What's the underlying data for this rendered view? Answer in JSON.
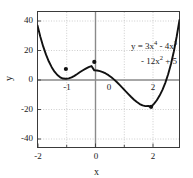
{
  "chart_data": {
    "type": "line",
    "title": "",
    "xlabel": "x",
    "ylabel": "y",
    "equation_line1": "y = 3x4 - 4x3",
    "equation_line2": "- 12x2 + 5",
    "equation_plain": "y = 3x^4 - 4x^3 - 12x^2 + 5",
    "xlim": [
      -2,
      3
    ],
    "ylim": [
      -50,
      47
    ],
    "xticks": [
      -2,
      0,
      2
    ],
    "xtick_labels": [
      "-2",
      "0",
      "2"
    ],
    "yticks": [
      -40,
      -20,
      0,
      20,
      40
    ],
    "ytick_labels": [
      "-40",
      "-20",
      "0",
      "20",
      "40"
    ],
    "inner_xticks": [
      -1,
      0,
      2
    ],
    "inner_xtick_labels": [
      "-1",
      "0",
      "2"
    ],
    "grid": true,
    "grid_style": "dotted",
    "legend": "none",
    "series": [
      {
        "name": "y = 3x^4 - 4x^3 - 12x^2 + 5",
        "x": [
          -2.0,
          -1.9,
          -1.8,
          -1.7,
          -1.6,
          -1.5,
          -1.4,
          -1.3,
          -1.2,
          -1.1,
          -1.0,
          -0.9,
          -0.8,
          -0.7,
          -0.6,
          -0.5,
          -0.4,
          -0.3,
          -0.2,
          -0.1,
          0.0,
          0.1,
          0.2,
          0.3,
          0.4,
          0.5,
          0.6,
          0.7,
          0.8,
          0.9,
          1.0,
          1.1,
          1.2,
          1.3,
          1.4,
          1.5,
          1.6,
          1.7,
          1.8,
          1.9,
          2.0,
          2.1,
          2.2,
          2.3,
          2.4,
          2.5,
          2.6,
          2.7,
          2.8,
          2.9,
          3.0
        ],
        "y": [
          37.0,
          29.0,
          22.1,
          16.2,
          11.3,
          7.3,
          4.1,
          1.7,
          0.1,
          -0.8,
          -1.0,
          -0.7,
          0.0,
          1.1,
          2.4,
          3.8,
          5.1,
          6.3,
          7.3,
          8.1,
          5.0,
          4.9,
          4.5,
          3.8,
          2.8,
          1.6,
          0.1,
          -1.6,
          -3.5,
          -5.5,
          -7.6,
          -9.8,
          -11.9,
          -14.0,
          -15.9,
          -17.6,
          -19.0,
          -20.0,
          -20.5,
          -20.4,
          -21.0,
          -18.9,
          -16.3,
          -13.0,
          -8.9,
          -3.9,
          2.2,
          9.6,
          18.5,
          29.0,
          41.0
        ]
      }
    ],
    "marked_points": [
      {
        "x": -1,
        "y": 6,
        "label": "local-minimum"
      },
      {
        "x": 0,
        "y": 11,
        "label": "local-maximum"
      },
      {
        "x": 2,
        "y": -21,
        "label": "absolute-minimum"
      }
    ],
    "colors": {
      "curve": "#111111",
      "axis": "#7a7a7a",
      "frame": "#3a3a3a",
      "grid": "#b9b9b9",
      "background": "#ffffff",
      "text": "#1a1a1a"
    }
  }
}
